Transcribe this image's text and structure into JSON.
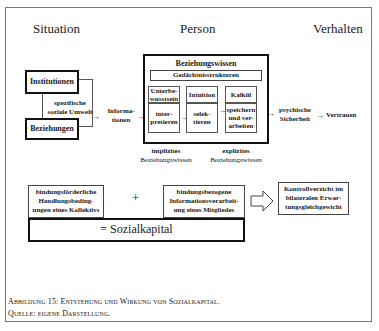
{
  "columns": {
    "situation": "Situation",
    "person": "Person",
    "verhalten": "Verhalten"
  },
  "situation": {
    "institutionen": "Institutionen",
    "beziehungen": "Beziehungen",
    "umwelt_line1": "spezifische",
    "umwelt_line2": "soziale Umwelt",
    "informationen_line1": "Informa-",
    "informationen_line2": "tionen"
  },
  "person": {
    "title": "Beziehungswissen",
    "memory": "Gedächtnisstrukturen",
    "stages": [
      {
        "top": "Unterbe-\nwusstsein",
        "top1": "Unterbe-",
        "top2": "wusstsein",
        "bottom1": "inter-",
        "bottom2": "pretieren"
      },
      {
        "top1": "Intuition",
        "bottom1": "selek-",
        "bottom2": "tieren"
      },
      {
        "top1": "Kalkül",
        "bottom1": "speichern",
        "bottom2": "und ver-",
        "bottom3": "arbeiten"
      }
    ],
    "implicit1": "implizites",
    "implicit2": "Beziehungswissen",
    "explicit1": "explizites",
    "explicit2": "Beziehungswissen"
  },
  "verhalten": {
    "sicherheit1": "psychische",
    "sicherheit2": "Sicherheit",
    "vertrauen": "Vertrauen"
  },
  "bottom": {
    "left1": "bindungsförderliche",
    "left2": "Handlungsbeding-",
    "left3": "ungen eines Kollektivs",
    "plus": "+",
    "mid1": "bindungsbezogene",
    "mid2": "Informationsverarbeit-",
    "mid3": "ung eines Mitgliedes",
    "right1": "Kontrollverzicht im",
    "right2": "bilateralen Erwar-",
    "right3": "tungsgleichgewicht",
    "sozialkapital": "= Sozialkapital"
  },
  "caption": {
    "line1": "Abbildung 15: Entstehung und Wirkung von Sozialkapital.",
    "line2": "Quelle: eigene Darstellung."
  }
}
